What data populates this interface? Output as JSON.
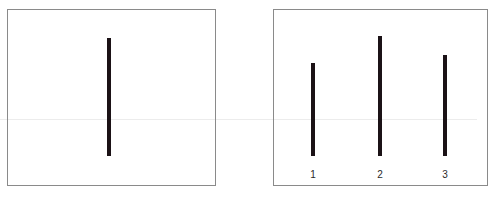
{
  "diagram": {
    "title": "",
    "colors": {
      "line": "#1b1216",
      "card_border": "#8a8a8a",
      "background": "#ffffff",
      "label": "#2a2a2a"
    },
    "reference_card": {
      "line": {
        "x": 109,
        "top": 38,
        "bottom": 156,
        "length_px": 118
      }
    },
    "comparison_card": {
      "lines": [
        {
          "label": "1",
          "x": 313,
          "top": 63,
          "bottom": 156,
          "length_px": 93
        },
        {
          "label": "2",
          "x": 380,
          "top": 36,
          "bottom": 156,
          "length_px": 120
        },
        {
          "label": "3",
          "x": 445,
          "top": 55,
          "bottom": 156,
          "length_px": 101
        }
      ],
      "label_y": 169
    }
  }
}
